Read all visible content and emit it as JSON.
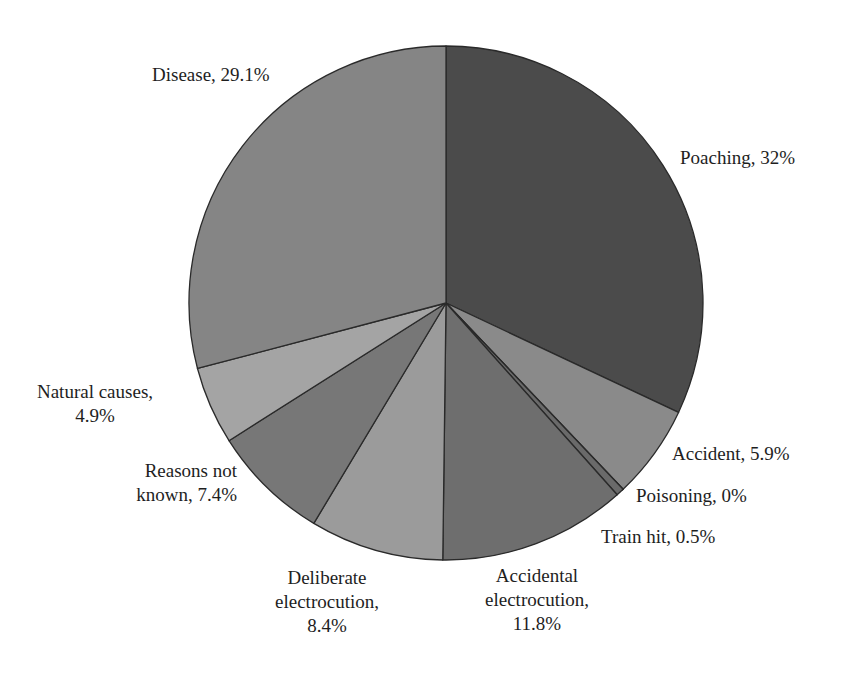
{
  "chart_data": {
    "type": "pie",
    "title": "",
    "start_angle_deg": 0,
    "direction": "clockwise",
    "slices": [
      {
        "name": "Poaching",
        "value": 32,
        "label": "Poaching, 32%",
        "color": "#4b4b4b"
      },
      {
        "name": "Accident",
        "value": 5.9,
        "label": "Accident, 5.9%",
        "color": "#8a8a8a"
      },
      {
        "name": "Poisoning",
        "value": 0,
        "label": "Poisoning, 0%",
        "color": "#7a7a7a"
      },
      {
        "name": "Train hit",
        "value": 0.5,
        "label": "Train hit, 0.5%",
        "color": "#6a6a6a"
      },
      {
        "name": "Accidental electrocution",
        "value": 11.8,
        "label": "Accidental electrocution, 11.8%",
        "color": "#6e6e6e"
      },
      {
        "name": "Deliberate electrocution",
        "value": 8.4,
        "label": "Deliberate electrocution, 8.4%",
        "color": "#9b9b9b"
      },
      {
        "name": "Reasons not known",
        "value": 7.4,
        "label": "Reasons not known, 7.4%",
        "color": "#777777"
      },
      {
        "name": "Natural causes",
        "value": 4.9,
        "label": "Natural causes, 4.9%",
        "color": "#a4a4a4"
      },
      {
        "name": "Disease",
        "value": 29.1,
        "label": "Disease, 29.1%",
        "color": "#858585"
      }
    ],
    "legend": "none (data labels beside slices)"
  },
  "labels": {
    "poaching": [
      "Poaching, 32%"
    ],
    "accident": [
      "Accident, 5.9%"
    ],
    "poisoning": [
      "Poisoning, 0%"
    ],
    "train_hit": [
      "Train hit, 0.5%"
    ],
    "accidental_electrocution": [
      "Accidental",
      "electrocution,",
      "11.8%"
    ],
    "deliberate_electrocution": [
      "Deliberate",
      "electrocution,",
      "8.4%"
    ],
    "reasons_not_known": [
      "Reasons not",
      "known, 7.4%"
    ],
    "natural_causes": [
      "Natural causes,",
      "4.9%"
    ],
    "disease": [
      "Disease, 29.1%"
    ]
  }
}
